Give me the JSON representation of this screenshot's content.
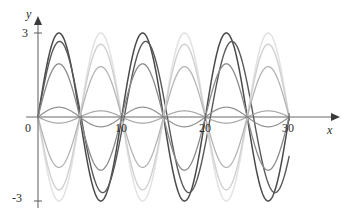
{
  "figure": {
    "title": "",
    "width": 348,
    "height": 222,
    "background": "#ffffff"
  },
  "axes": {
    "y_axis_label": "y",
    "x_axis_label": "x",
    "origin_label": "0",
    "y_ticks": [
      {
        "value": 3,
        "label": "3"
      },
      {
        "value": -3,
        "label": "-3"
      }
    ],
    "x_ticks": [
      {
        "value": 10,
        "label": "10"
      },
      {
        "value": 20,
        "label": "20"
      },
      {
        "value": 30,
        "label": "30"
      }
    ],
    "axis_color": "#6b6b6b",
    "arrow_color": "#3a3a3a"
  },
  "chart_data": {
    "type": "line",
    "title": "",
    "xlabel": "x",
    "ylabel": "y",
    "xlim": [
      0,
      34
    ],
    "ylim": [
      -3.6,
      3.4
    ],
    "grid": false,
    "legend": "none",
    "x_ticks": [
      0,
      10,
      20,
      30
    ],
    "y_ticks": [
      -3,
      0,
      3
    ],
    "period_units": 10,
    "series": [
      {
        "name": "curve-1-amp3-dark",
        "amplitude": 3.0,
        "period": 10.0,
        "phase": 0.0,
        "color": "#4a4a4a",
        "width": 1.5,
        "samples_x": [
          0,
          1.25,
          2.5,
          3.75,
          5,
          6.25,
          7.5,
          8.75,
          10,
          11.25,
          12.5,
          13.75,
          15,
          16.25,
          17.5,
          18.75,
          20,
          21.25,
          22.5,
          23.75,
          25,
          26.25,
          27.5,
          28.75,
          30
        ],
        "samples_y": [
          0,
          2.12,
          3.0,
          2.12,
          0,
          -2.12,
          -3.0,
          -2.12,
          0,
          2.12,
          3.0,
          2.12,
          0,
          -2.12,
          -3.0,
          -2.12,
          0,
          2.12,
          3.0,
          2.12,
          0,
          -2.12,
          -3.0,
          -2.12,
          0
        ]
      },
      {
        "name": "curve-2-amp2.7-dark",
        "amplitude": 2.7,
        "period": 10.3,
        "phase": 0.0,
        "color": "#585858",
        "width": 1.4,
        "samples_x": [
          0,
          2.57,
          5.15,
          7.72,
          10.3,
          12.87,
          15.45,
          18.02,
          20.6,
          23.17,
          25.75,
          28.32,
          30
        ],
        "samples_y": [
          0,
          2.7,
          0,
          -2.7,
          0,
          2.7,
          0,
          -2.7,
          0,
          2.7,
          0,
          -2.7,
          -1.8
        ]
      },
      {
        "name": "curve-3-amp1.9-medium",
        "amplitude": 1.9,
        "period": 10.0,
        "phase": 0.0,
        "color": "#8a8a8a",
        "width": 1.3,
        "samples_x": [
          0,
          2.5,
          5,
          7.5,
          10,
          12.5,
          15,
          17.5,
          20,
          22.5,
          25,
          27.5,
          30
        ],
        "samples_y": [
          0,
          1.9,
          0,
          -1.9,
          0,
          1.9,
          0,
          -1.9,
          0,
          1.9,
          0,
          -1.9,
          0
        ]
      },
      {
        "name": "curve-4-amp3-light",
        "amplitude": 3.0,
        "period": 10.0,
        "phase": 5.0,
        "color": "#e2e2e2",
        "width": 1.5,
        "samples_x": [
          0,
          2.5,
          5,
          7.5,
          10,
          12.5,
          15,
          17.5,
          20,
          22.5,
          25,
          27.5,
          30
        ],
        "samples_y": [
          0,
          -3.0,
          0,
          3.0,
          0,
          -3.0,
          0,
          3.0,
          0,
          -3.0,
          0,
          3.0,
          0
        ]
      },
      {
        "name": "curve-5-amp2.6-light",
        "amplitude": 2.6,
        "period": 10.0,
        "phase": 5.0,
        "color": "#d0d0d0",
        "width": 1.4,
        "samples_x": [
          0,
          2.5,
          5,
          7.5,
          10,
          12.5,
          15,
          17.5,
          20,
          22.5,
          25,
          27.5,
          30
        ],
        "samples_y": [
          0,
          -2.6,
          0,
          2.6,
          0,
          -2.6,
          0,
          2.6,
          0,
          -2.6,
          0,
          2.6,
          0
        ]
      },
      {
        "name": "curve-6-amp1.8-light",
        "amplitude": 1.8,
        "period": 10.0,
        "phase": 5.0,
        "color": "#b4b4b4",
        "width": 1.3,
        "samples_x": [
          0,
          2.5,
          5,
          7.5,
          10,
          12.5,
          15,
          17.5,
          20,
          22.5,
          25,
          27.5,
          30
        ],
        "samples_y": [
          0,
          -1.8,
          0,
          1.8,
          0,
          -1.8,
          0,
          1.8,
          0,
          -1.8,
          0,
          1.8,
          0
        ]
      },
      {
        "name": "curve-7-amp0.35-flat",
        "amplitude": 0.35,
        "period": 10.0,
        "phase": 0.0,
        "color": "#909090",
        "width": 1.2,
        "samples_x": [
          0,
          2.5,
          5,
          7.5,
          10,
          12.5,
          15,
          17.5,
          20,
          22.5,
          25,
          27.5,
          30
        ],
        "samples_y": [
          0,
          0.35,
          0,
          -0.35,
          0,
          0.35,
          0,
          -0.35,
          0,
          0.35,
          0,
          -0.35,
          0
        ]
      },
      {
        "name": "curve-8-amp0.22-flat",
        "amplitude": 0.22,
        "period": 10.0,
        "phase": 5.0,
        "color": "#a8a8a8",
        "width": 1.2,
        "samples_x": [
          0,
          2.5,
          5,
          7.5,
          10,
          12.5,
          15,
          17.5,
          20,
          22.5,
          25,
          27.5,
          30
        ],
        "samples_y": [
          0,
          -0.22,
          0,
          0.22,
          0,
          -0.22,
          0,
          0.22,
          0,
          -0.22,
          0,
          0.22,
          0
        ]
      }
    ]
  },
  "geometry": {
    "origin_px": {
      "x": 38,
      "y": 117
    },
    "px_per_x_unit": 8.37,
    "px_per_y_unit": 28.0,
    "x_axis_end_px": 344,
    "y_axis_top_px": 18,
    "y_axis_bottom_px": 208
  }
}
